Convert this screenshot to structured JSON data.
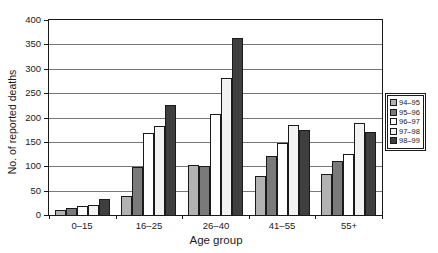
{
  "chart_data": {
    "type": "bar",
    "title": "",
    "xlabel": "Age group",
    "ylabel": "No. of reported deaths",
    "ylim": [
      0,
      400
    ],
    "yticks": [
      0,
      50,
      100,
      150,
      200,
      250,
      300,
      350,
      400
    ],
    "grid": true,
    "legend_position": "right",
    "categories": [
      "0–15",
      "16–25",
      "26–40",
      "41–55",
      "55+"
    ],
    "series": [
      {
        "name": "94–95",
        "color": "#b2b2b2",
        "values": [
          10,
          38,
          103,
          80,
          85
        ]
      },
      {
        "name": "95–96",
        "color": "#7a7a7a",
        "values": [
          15,
          98,
          100,
          120,
          110
        ]
      },
      {
        "name": "96–97",
        "color": "#ffffff",
        "values": [
          19,
          168,
          207,
          148,
          125
        ]
      },
      {
        "name": "97–98",
        "color": "#f2f2f2",
        "values": [
          21,
          182,
          280,
          185,
          188
        ]
      },
      {
        "name": "98–99",
        "color": "#3f3f3f",
        "values": [
          32,
          225,
          363,
          175,
          170
        ]
      }
    ]
  }
}
